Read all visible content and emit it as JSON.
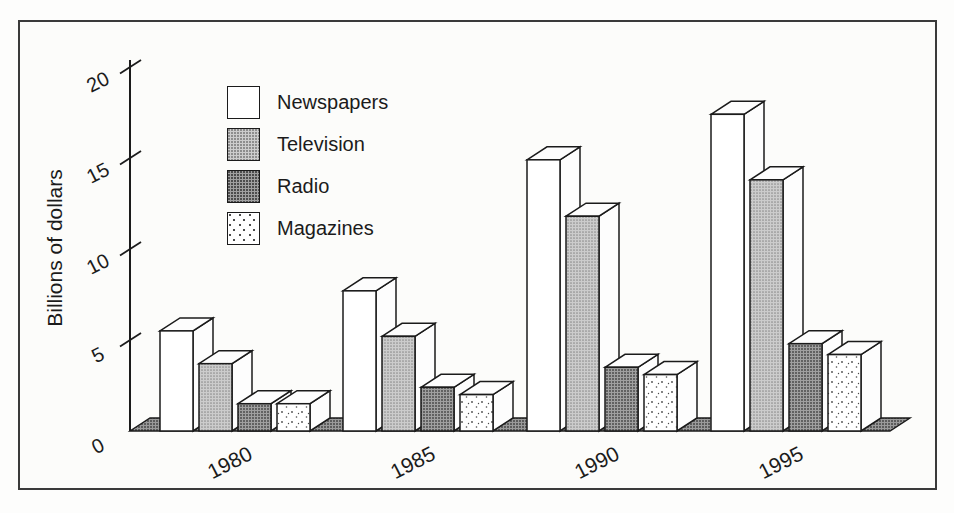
{
  "chart_data": {
    "type": "bar",
    "subtype": "3d-grouped-bar",
    "title": "",
    "ylabel": "Billions of dollars",
    "xlabel": "",
    "categories": [
      "1980",
      "1985",
      "1990",
      "1995"
    ],
    "yticks": [
      0,
      5,
      10,
      15,
      20
    ],
    "ylim": [
      0,
      20
    ],
    "grid": false,
    "legend_position": "upper-left-inside",
    "units": "billions of dollars",
    "series": [
      {
        "name": "Newspapers",
        "values": [
          5.5,
          7.7,
          14.9,
          17.4
        ]
      },
      {
        "name": "Television",
        "values": [
          3.7,
          5.2,
          11.8,
          13.8
        ]
      },
      {
        "name": "Radio",
        "values": [
          1.5,
          2.4,
          3.5,
          4.8
        ]
      },
      {
        "name": "Magazines",
        "values": [
          1.5,
          2.0,
          3.1,
          4.2
        ]
      }
    ]
  },
  "colors": {
    "outline": "#1b1b1b",
    "newspapers_fill": "#ffffff",
    "television_fill": "#c6c6c6",
    "radio_fill": "#8f8f8f",
    "magazines_fill": "#ffffff",
    "floor_fill": "#909090",
    "face_white": "#fdfdfd",
    "frame_border": "#3a3a3a",
    "background": "#fcfcfa"
  }
}
